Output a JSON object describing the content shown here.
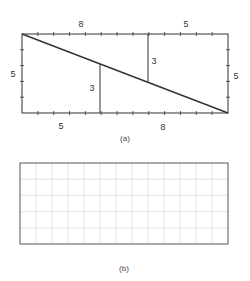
{
  "figure_a": {
    "caption": "(a)",
    "rect": {
      "x": 22,
      "y": 34,
      "w": 206,
      "h": 79
    },
    "units": {
      "width": 13,
      "height": 5
    },
    "labels": {
      "top_left": "8",
      "top_right": "5",
      "left": "5",
      "right": "5",
      "bottom_left": "5",
      "bottom_right": "8",
      "upper_vertical": "3",
      "lower_vertical": "3"
    },
    "line_color": "#333333"
  },
  "figure_b": {
    "caption": "(b)",
    "rect": {
      "x": 20,
      "y": 163,
      "w": 208,
      "h": 81
    },
    "grid": {
      "cols": 13,
      "rows": 5
    },
    "grid_color": "#dcdcdc",
    "border_color": "#555555"
  }
}
